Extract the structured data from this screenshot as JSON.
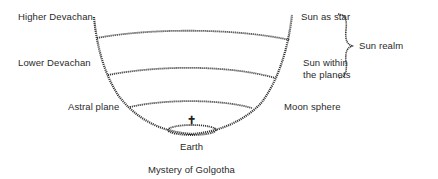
{
  "diagram": {
    "type": "cosmological-bowl-diagram",
    "left_labels": [
      {
        "id": "higher-devachan",
        "text": "Higher Devachan"
      },
      {
        "id": "lower-devachan",
        "text": "Lower Devachan"
      },
      {
        "id": "astral-plane",
        "text": "Astral plane"
      }
    ],
    "right_labels": [
      {
        "id": "sun-as-star",
        "text": "Sun as star"
      },
      {
        "id": "sun-within-planets",
        "line1": "Sun within",
        "line2": "the planets"
      },
      {
        "id": "moon-sphere",
        "text": "Moon sphere"
      }
    ],
    "brace_label": "Sun realm",
    "bottom": {
      "earth_label": "Earth",
      "cross_symbol": "✝",
      "caption": "Mystery of Golgotha"
    },
    "colors": {
      "line": "#333333",
      "text": "#2a2a2a",
      "background": "#ffffff"
    }
  }
}
